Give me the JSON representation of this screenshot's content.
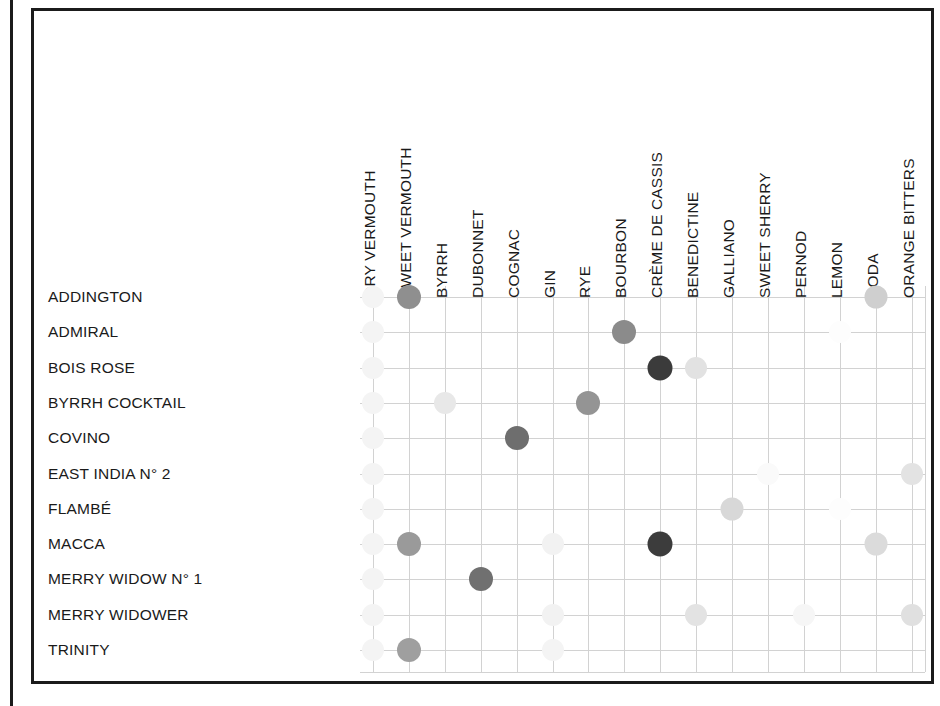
{
  "figure": {
    "type": "dot-matrix-chart",
    "frame": {
      "border_color": "#1b1b1b",
      "background": "#ffffff"
    }
  },
  "chart_data": {
    "type": "heatmap",
    "title": "",
    "subtitle": "",
    "xlabel": "",
    "ylabel": "",
    "grid": true,
    "legend": "none",
    "encoding": "Filled circle per ingredient used in each cocktail; circle darkness encodes relative proportion (darker = larger share).",
    "categories": [
      "DRY VERMOUTH",
      "SWEET VERMOUTH",
      "BYRRH",
      "DUBONNET",
      "COGNAC",
      "GIN",
      "RYE",
      "BOURBON",
      "CRÈME DE CASSIS",
      "BENEDICTINE",
      "GALLIANO",
      "SWEET SHERRY",
      "PERNOD",
      "LEMON",
      "SODA",
      "ORANGE BITTERS"
    ],
    "rows": [
      "ADDINGTON",
      "ADMIRAL",
      "BOIS ROSE",
      "BYRRH COCKTAIL",
      "COVINO",
      "EAST INDIA N° 2",
      "FLAMBÉ",
      "MACCA",
      "MERRY WIDOW N° 1",
      "MERRY WIDOWER",
      "TRINITY"
    ],
    "points": [
      {
        "row": 0,
        "col": 0,
        "shade": "#f4f4f4"
      },
      {
        "row": 0,
        "col": 1,
        "shade": "#8f8f8f"
      },
      {
        "row": 0,
        "col": 14,
        "shade": "#cfcfcf"
      },
      {
        "row": 1,
        "col": 0,
        "shade": "#f4f4f4"
      },
      {
        "row": 1,
        "col": 7,
        "shade": "#8b8b8b"
      },
      {
        "row": 1,
        "col": 13,
        "shade": "#fdfdfd"
      },
      {
        "row": 2,
        "col": 0,
        "shade": "#f4f4f4"
      },
      {
        "row": 2,
        "col": 8,
        "shade": "#3b3b3b"
      },
      {
        "row": 2,
        "col": 9,
        "shade": "#e2e2e2"
      },
      {
        "row": 3,
        "col": 0,
        "shade": "#f4f4f4"
      },
      {
        "row": 3,
        "col": 2,
        "shade": "#e8e8e8"
      },
      {
        "row": 3,
        "col": 6,
        "shade": "#949494"
      },
      {
        "row": 4,
        "col": 0,
        "shade": "#f4f4f4"
      },
      {
        "row": 4,
        "col": 4,
        "shade": "#6e6e6e"
      },
      {
        "row": 5,
        "col": 0,
        "shade": "#f4f4f4"
      },
      {
        "row": 5,
        "col": 11,
        "shade": "#fafafa"
      },
      {
        "row": 5,
        "col": 15,
        "shade": "#e3e3e3"
      },
      {
        "row": 6,
        "col": 0,
        "shade": "#f4f4f4"
      },
      {
        "row": 6,
        "col": 10,
        "shade": "#d8d8d8"
      },
      {
        "row": 6,
        "col": 13,
        "shade": "#fdfdfd"
      },
      {
        "row": 7,
        "col": 0,
        "shade": "#f4f4f4"
      },
      {
        "row": 7,
        "col": 1,
        "shade": "#9a9a9a"
      },
      {
        "row": 7,
        "col": 5,
        "shade": "#f2f2f2"
      },
      {
        "row": 7,
        "col": 8,
        "shade": "#3c3c3c"
      },
      {
        "row": 7,
        "col": 14,
        "shade": "#dbdbdb"
      },
      {
        "row": 8,
        "col": 0,
        "shade": "#f4f4f4"
      },
      {
        "row": 8,
        "col": 3,
        "shade": "#707070"
      },
      {
        "row": 9,
        "col": 0,
        "shade": "#f4f4f4"
      },
      {
        "row": 9,
        "col": 5,
        "shade": "#f2f2f2"
      },
      {
        "row": 9,
        "col": 9,
        "shade": "#e3e3e3"
      },
      {
        "row": 9,
        "col": 12,
        "shade": "#f6f6f6"
      },
      {
        "row": 9,
        "col": 15,
        "shade": "#e0e0e0"
      },
      {
        "row": 10,
        "col": 0,
        "shade": "#f4f4f4"
      },
      {
        "row": 10,
        "col": 1,
        "shade": "#9f9f9f"
      },
      {
        "row": 10,
        "col": 5,
        "shade": "#f4f4f4"
      }
    ]
  }
}
